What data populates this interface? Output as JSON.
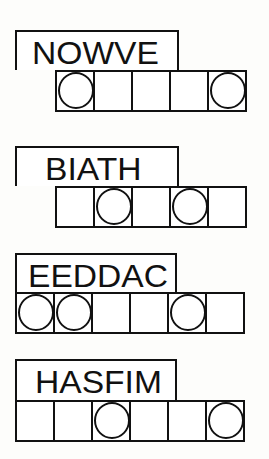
{
  "puzzles": [
    {
      "scrambled": "NOWVE",
      "cells": 6,
      "start_cell": 1,
      "circled": [
        1,
        5
      ]
    },
    {
      "scrambled": "BIATH",
      "cells": 5,
      "circled": [
        2,
        4
      ]
    },
    {
      "scrambled": "EEDDAC",
      "cells": 6,
      "circled": [
        1,
        2,
        5
      ]
    },
    {
      "scrambled": "HASFIM",
      "cells": 6,
      "circled": [
        3,
        6
      ]
    }
  ]
}
